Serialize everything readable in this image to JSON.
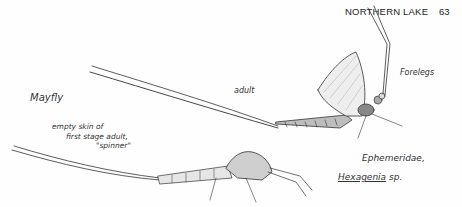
{
  "header": {
    "running_head": "NORTHERN LAKE",
    "page_number": "63"
  },
  "figure": {
    "title": "Mayfly",
    "labels": {
      "adult": "adult",
      "forelegs": "Forelegs",
      "empty_skin_line1": "empty skin of",
      "empty_skin_line2": "first stage adult,",
      "empty_skin_line3": "\"spinner\"",
      "family": "Ephemeridae,",
      "genus": "Hexagenia",
      "species_abbr": "sp."
    },
    "subjects": [
      "adult mayfly",
      "shed skin (spinner)"
    ]
  }
}
